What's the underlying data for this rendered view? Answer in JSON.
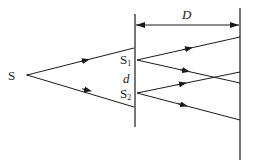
{
  "diagram": {
    "type": "double-slit interference (Young's experiment) schematic",
    "labels": {
      "source": "S",
      "slit1_main": "S",
      "slit1_sub": "1",
      "slit2_main": "S",
      "slit2_sub": "2",
      "slit_separation": "d",
      "screen_distance": "D"
    },
    "colors": {
      "line": "#1a1a1a",
      "background": "#ffffff"
    },
    "elements": {
      "source_point": {
        "x": 27,
        "y": 75
      },
      "slit_barrier": {
        "x": 135,
        "y1": 14,
        "y2": 127
      },
      "screen": {
        "x": 240,
        "y1": 8,
        "y2": 160
      },
      "slit1": {
        "x": 136,
        "y": 60
      },
      "slit2": {
        "x": 136,
        "y": 93
      },
      "distance_arrow": {
        "y": 25,
        "x1": 135,
        "x2": 240
      }
    },
    "rays": [
      {
        "from": "S",
        "to": "barrier-upper",
        "x1": 27,
        "y1": 75,
        "x2": 134,
        "y2": 48
      },
      {
        "from": "S",
        "to": "barrier-lower",
        "x1": 27,
        "y1": 75,
        "x2": 134,
        "y2": 107
      },
      {
        "from": "S1",
        "to": "screen",
        "x1": 137,
        "y1": 60,
        "x2": 240,
        "y2": 37
      },
      {
        "from": "S1",
        "to": "screen",
        "x1": 137,
        "y1": 60,
        "x2": 240,
        "y2": 83
      },
      {
        "from": "S2",
        "to": "screen",
        "x1": 137,
        "y1": 93,
        "x2": 240,
        "y2": 72
      },
      {
        "from": "S2",
        "to": "screen",
        "x1": 137,
        "y1": 93,
        "x2": 240,
        "y2": 120
      }
    ]
  }
}
